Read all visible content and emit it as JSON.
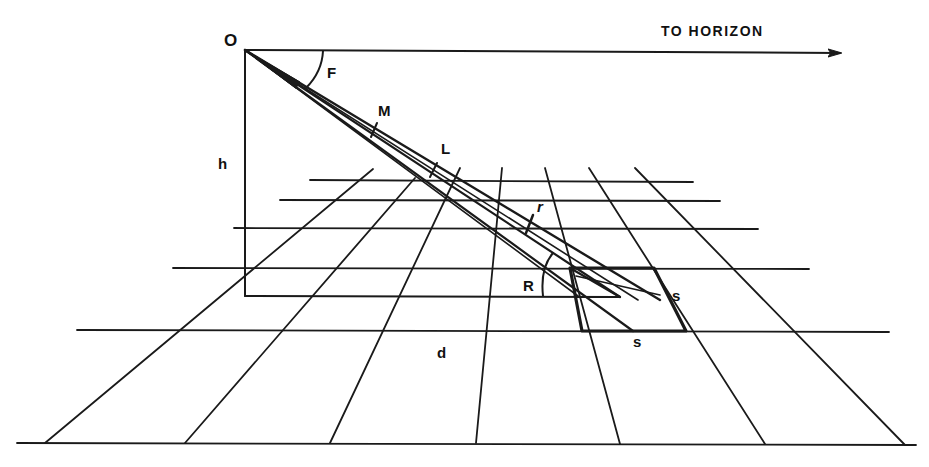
{
  "diagram": {
    "horizon_label": "TO HORIZON",
    "labels": {
      "observer": "O",
      "angle_f": "F",
      "point_m": "M",
      "point_l": "L",
      "height": "h",
      "small_r": "r",
      "angle_r": "R",
      "distance": "d",
      "side_s_right": "s",
      "side_s_bottom": "s"
    },
    "colors": {
      "ink": "#1a1a1a",
      "background": "#ffffff"
    }
  }
}
